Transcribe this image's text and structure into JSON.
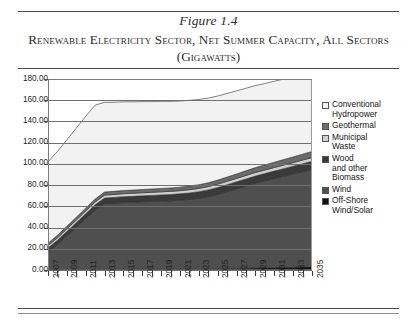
{
  "figure": {
    "number": "Figure 1.4",
    "title": "Renewable Electricity Sector, Net Summer Capacity,\nAll Sectors (Gigawatts)"
  },
  "legend": {
    "items": [
      {
        "label": "Conventional\nHydropower",
        "color": "#f2f2f2",
        "name": "conventional-hydropower"
      },
      {
        "label": "Geothermal",
        "color": "#6b6b6b",
        "name": "geothermal"
      },
      {
        "label": "Municipal\nWaste",
        "color": "#d0d0d0",
        "name": "municipal-waste"
      },
      {
        "label": "Wood\nand other\nBiomass",
        "color": "#3a3a3a",
        "name": "wood-and-other-biomass"
      },
      {
        "label": "Wind",
        "color": "#4f4f4f",
        "name": "wind"
      },
      {
        "label": "Off-Shore\nWind/Solar",
        "color": "#111111",
        "name": "off-shore-wind-solar"
      }
    ]
  },
  "chart_data": {
    "type": "area",
    "stacked": true,
    "title": "Renewable Electricity Sector, Net Summer Capacity, All Sectors (Gigawatts)",
    "xlabel": "",
    "ylabel": "",
    "ylim": [
      0,
      180
    ],
    "ytick_step": 20,
    "ytick_labels": [
      "0.00",
      "20.00",
      "40.00",
      "60.00",
      "80.00",
      "100.00",
      "120.00",
      "140.00",
      "160.00",
      "180.00"
    ],
    "grid": true,
    "legend_position": "right",
    "x": [
      2007,
      2008,
      2009,
      2010,
      2011,
      2012,
      2013,
      2014,
      2015,
      2016,
      2017,
      2018,
      2019,
      2020,
      2021,
      2022,
      2023,
      2024,
      2025,
      2026,
      2027,
      2028,
      2029,
      2030,
      2031,
      2032,
      2033,
      2034,
      2035
    ],
    "xtick_labels": [
      "2007",
      "2009",
      "2011",
      "2013",
      "2015",
      "2017",
      "2019",
      "2021",
      "2023",
      "2025",
      "2027",
      "2029",
      "2031",
      "2033",
      "2035"
    ],
    "series": [
      {
        "name": "Off-Shore Wind/Solar",
        "color": "#111111",
        "values": [
          0.2,
          0.2,
          0.3,
          0.3,
          0.4,
          0.5,
          0.6,
          0.6,
          0.7,
          0.7,
          0.8,
          0.8,
          0.9,
          0.9,
          1.0,
          1.0,
          1.1,
          1.2,
          1.3,
          1.4,
          1.5,
          1.6,
          1.8,
          2.0,
          2.2,
          2.4,
          2.6,
          2.8,
          3.0
        ]
      },
      {
        "name": "Wind",
        "color": "#4f4f4f",
        "values": [
          17.0,
          24.0,
          32.0,
          40.0,
          48.0,
          56.0,
          62.0,
          62.5,
          63.0,
          63.2,
          63.5,
          63.8,
          64.0,
          64.3,
          64.8,
          65.5,
          66.5,
          68.0,
          70.0,
          72.5,
          75.0,
          77.5,
          80.0,
          82.0,
          84.0,
          86.0,
          88.0,
          90.0,
          92.0
        ]
      },
      {
        "name": "Wood and other Biomass",
        "color": "#3a3a3a",
        "values": [
          3.6,
          3.8,
          4.0,
          4.3,
          4.6,
          4.9,
          5.2,
          5.3,
          5.4,
          5.5,
          5.6,
          5.7,
          5.8,
          5.9,
          6.0,
          6.1,
          6.2,
          6.3,
          6.4,
          6.5,
          6.6,
          6.7,
          6.8,
          6.9,
          7.0,
          7.1,
          7.2,
          7.3,
          7.4
        ]
      },
      {
        "name": "Municipal Waste",
        "color": "#d0d0d0",
        "values": [
          2.2,
          2.3,
          2.4,
          2.5,
          2.6,
          2.7,
          2.8,
          2.8,
          2.8,
          2.9,
          2.9,
          2.9,
          3.0,
          3.0,
          3.0,
          3.1,
          3.1,
          3.1,
          3.2,
          3.2,
          3.2,
          3.3,
          3.3,
          3.3,
          3.4,
          3.4,
          3.4,
          3.5,
          3.5
        ]
      },
      {
        "name": "Geothermal",
        "color": "#6b6b6b",
        "values": [
          2.3,
          2.4,
          2.5,
          2.6,
          2.7,
          2.8,
          2.9,
          2.9,
          3.0,
          3.0,
          3.1,
          3.1,
          3.2,
          3.2,
          3.3,
          3.4,
          3.5,
          3.6,
          3.8,
          4.0,
          4.2,
          4.4,
          4.6,
          4.8,
          5.0,
          5.2,
          5.4,
          5.6,
          5.8
        ]
      },
      {
        "name": "Conventional Hydropower",
        "color": "#f2f2f2",
        "values": [
          76.7,
          79.0,
          81.5,
          84.0,
          86.5,
          88.5,
          84.5,
          84.0,
          83.6,
          83.2,
          82.8,
          82.4,
          82.0,
          81.6,
          81.2,
          80.8,
          80.3,
          79.8,
          79.3,
          78.8,
          78.3,
          77.8,
          77.3,
          76.8,
          76.3,
          75.8,
          75.3,
          74.8,
          74.3
        ]
      }
    ],
    "totals": [
      102.0,
      111.7,
      122.7,
      133.7,
      144.8,
      155.4,
      158.0,
      158.1,
      158.5,
      158.5,
      158.7,
      158.7,
      158.9,
      158.9,
      159.3,
      159.9,
      160.7,
      162.0,
      164.0,
      166.4,
      168.8,
      171.3,
      173.8,
      175.8,
      177.9,
      179.9,
      181.9,
      184.0,
      186.0
    ]
  }
}
